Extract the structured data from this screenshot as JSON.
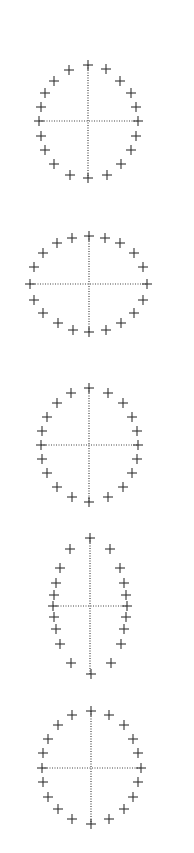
{
  "colors": {
    "marker": "#333333",
    "axis": "#444444",
    "background": "#ffffff"
  },
  "marker": {
    "symbol": "plus",
    "size": 10
  },
  "ellipses": [
    {
      "name": "ellipse-1",
      "center": [
        88,
        121
      ],
      "h_axis": [
        39,
        138
      ],
      "v_axis": [
        65,
        178
      ],
      "points": [
        [
          88,
          65
        ],
        [
          106,
          69
        ],
        [
          69,
          70
        ],
        [
          120,
          81
        ],
        [
          54,
          81
        ],
        [
          131,
          93
        ],
        [
          45,
          93
        ],
        [
          136,
          107
        ],
        [
          41,
          107
        ],
        [
          138,
          121
        ],
        [
          39,
          121
        ],
        [
          136,
          136
        ],
        [
          41,
          136
        ],
        [
          131,
          150
        ],
        [
          45,
          150
        ],
        [
          121,
          164
        ],
        [
          54,
          164
        ],
        [
          107,
          175
        ],
        [
          70,
          175
        ],
        [
          88,
          178
        ]
      ]
    },
    {
      "name": "ellipse-2",
      "center": [
        89,
        284
      ],
      "h_axis": [
        30,
        147
      ],
      "v_axis": [
        236,
        332
      ],
      "points": [
        [
          89,
          236
        ],
        [
          105,
          238
        ],
        [
          72,
          238
        ],
        [
          120,
          243
        ],
        [
          57,
          243
        ],
        [
          134,
          253
        ],
        [
          43,
          253
        ],
        [
          143,
          267
        ],
        [
          34,
          267
        ],
        [
          147,
          284
        ],
        [
          30,
          284
        ],
        [
          143,
          300
        ],
        [
          34,
          300
        ],
        [
          134,
          313
        ],
        [
          43,
          313
        ],
        [
          121,
          323
        ],
        [
          58,
          323
        ],
        [
          106,
          330
        ],
        [
          73,
          330
        ],
        [
          89,
          332
        ]
      ]
    },
    {
      "name": "ellipse-3",
      "center": [
        89,
        445
      ],
      "h_axis": [
        41,
        138
      ],
      "v_axis": [
        388,
        502
      ],
      "points": [
        [
          89,
          388
        ],
        [
          108,
          393
        ],
        [
          71,
          393
        ],
        [
          123,
          403
        ],
        [
          57,
          403
        ],
        [
          132,
          417
        ],
        [
          47,
          417
        ],
        [
          137,
          431
        ],
        [
          42,
          431
        ],
        [
          138,
          445
        ],
        [
          41,
          445
        ],
        [
          137,
          459
        ],
        [
          42,
          459
        ],
        [
          132,
          473
        ],
        [
          47,
          473
        ],
        [
          123,
          487
        ],
        [
          57,
          487
        ],
        [
          108,
          497
        ],
        [
          72,
          497
        ],
        [
          89,
          502
        ]
      ]
    },
    {
      "name": "ellipse-4",
      "center": [
        90,
        606
      ],
      "h_axis": [
        53,
        127
      ],
      "v_axis": [
        538,
        674
      ],
      "points": [
        [
          90,
          538
        ],
        [
          110,
          549
        ],
        [
          70,
          549
        ],
        [
          120,
          568
        ],
        [
          60,
          568
        ],
        [
          124,
          583
        ],
        [
          56,
          583
        ],
        [
          126,
          595
        ],
        [
          54,
          595
        ],
        [
          127,
          606
        ],
        [
          53,
          606
        ],
        [
          126,
          617
        ],
        [
          54,
          617
        ],
        [
          124,
          629
        ],
        [
          56,
          629
        ],
        [
          121,
          644
        ],
        [
          60,
          644
        ],
        [
          111,
          663
        ],
        [
          71,
          663
        ],
        [
          91,
          674
        ]
      ]
    },
    {
      "name": "ellipse-5",
      "center": [
        91,
        768
      ],
      "h_axis": [
        42,
        141
      ],
      "v_axis": [
        711,
        824
      ],
      "points": [
        [
          91,
          711
        ],
        [
          109,
          715
        ],
        [
          72,
          715
        ],
        [
          124,
          725
        ],
        [
          58,
          725
        ],
        [
          133,
          739
        ],
        [
          48,
          739
        ],
        [
          138,
          753
        ],
        [
          43,
          753
        ],
        [
          141,
          768
        ],
        [
          42,
          768
        ],
        [
          138,
          782
        ],
        [
          43,
          782
        ],
        [
          133,
          797
        ],
        [
          48,
          797
        ],
        [
          124,
          809
        ],
        [
          58,
          809
        ],
        [
          109,
          819
        ],
        [
          72,
          819
        ],
        [
          91,
          824
        ]
      ]
    }
  ]
}
